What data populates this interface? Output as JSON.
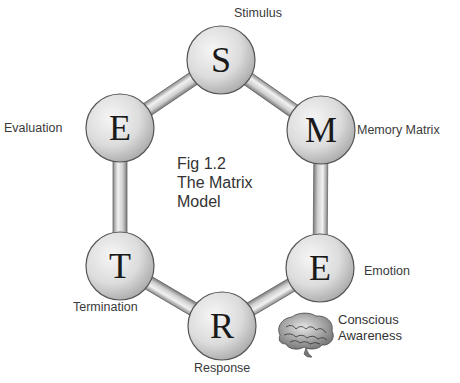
{
  "figure": {
    "caption_lines": [
      "Fig 1.2",
      "The Matrix",
      "Model"
    ]
  },
  "nodes": [
    {
      "letter": "S",
      "label": "Stimulus",
      "cx": 221,
      "cy": 60
    },
    {
      "letter": "M",
      "label": "Memory Matrix",
      "cx": 321,
      "cy": 130
    },
    {
      "letter": "E",
      "label": "Emotion",
      "cx": 320,
      "cy": 268
    },
    {
      "letter": "R",
      "label": "Response",
      "cx": 222,
      "cy": 326
    },
    {
      "letter": "T",
      "label": "Termination",
      "cx": 120,
      "cy": 266
    },
    {
      "letter": "E",
      "label": "Evaluation",
      "cx": 120,
      "cy": 128
    }
  ],
  "annotation": {
    "icon": "brain-icon",
    "lines": [
      "Conscious",
      "Awareness"
    ]
  },
  "colors": {
    "node_fill_light": "#f4f4f4",
    "node_fill_dark": "#a8a8a8",
    "node_stroke": "#555555",
    "connector_light": "#eeeeee",
    "connector_dark": "#8a8a8a",
    "text": "#333333"
  }
}
